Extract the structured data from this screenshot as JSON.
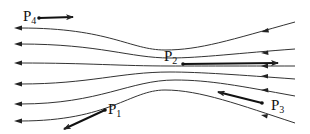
{
  "diagram": {
    "flow_direction": "right-to-left",
    "streamline_count": 6,
    "colors": {
      "stroke": "#222222",
      "background": "#ffffff"
    },
    "points": [
      {
        "id": "P1",
        "base": "P",
        "sub": "1",
        "dot": [
          105,
          110
        ],
        "arrow_to": [
          62,
          130
        ],
        "label_pos": [
          108,
          114
        ]
      },
      {
        "id": "P2",
        "base": "P",
        "sub": "2",
        "dot": [
          183,
          64
        ],
        "arrow_to": [
          280,
          63
        ],
        "label_pos": [
          164,
          61
        ]
      },
      {
        "id": "P3",
        "base": "P",
        "sub": "3",
        "dot": [
          262,
          103
        ],
        "arrow_to": [
          216,
          92
        ],
        "label_pos": [
          271,
          112
        ]
      },
      {
        "id": "P4",
        "base": "P",
        "sub": "4",
        "dot": [
          39,
          18
        ],
        "arrow_to": [
          75,
          17
        ],
        "label_pos": [
          23,
          21
        ]
      }
    ]
  }
}
